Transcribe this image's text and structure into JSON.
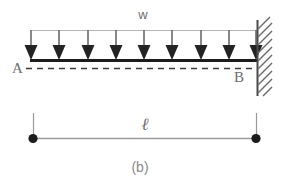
{
  "figure": {
    "type": "engineering-beam-diagram",
    "caption": "(b)",
    "labels": {
      "load": "w",
      "left_support": "A",
      "right_support": "B",
      "length": "ℓ"
    },
    "colors": {
      "beam": "#1c1c1c",
      "arrow": "#5f5f5f",
      "arrowhead": "#1c1c1c",
      "guide_line": "#b6b6b6",
      "dashed_line": "#3a3a3a",
      "wall": "#4a4a4a",
      "hatch": "#6a6a6a",
      "dimension": "#9a9a9a",
      "dot": "#1c1c1c",
      "text": "#6e6e6e",
      "background": "#ffffff"
    },
    "geometry": {
      "beam_left_x": 31,
      "beam_right_x": 257,
      "beam_y": 60,
      "load_line_y": 30,
      "dashed_line_y": 68,
      "wall_x": 257,
      "wall_top_y": 20,
      "wall_bottom_y": 96,
      "arrow_count": 9,
      "arrow_spacing": 28.25,
      "dimension_y": 138,
      "dimension_left_x": 33,
      "dimension_right_x": 256,
      "ext_line_top_y": 113
    },
    "load_arrows": {
      "count": 9,
      "x_positions": [
        31,
        59,
        88,
        116,
        144,
        172,
        201,
        229,
        257
      ],
      "top_y": 30,
      "tip_y": 59
    },
    "hatch_marks": {
      "count": 10,
      "angle_deg": 45,
      "length": 14
    }
  }
}
